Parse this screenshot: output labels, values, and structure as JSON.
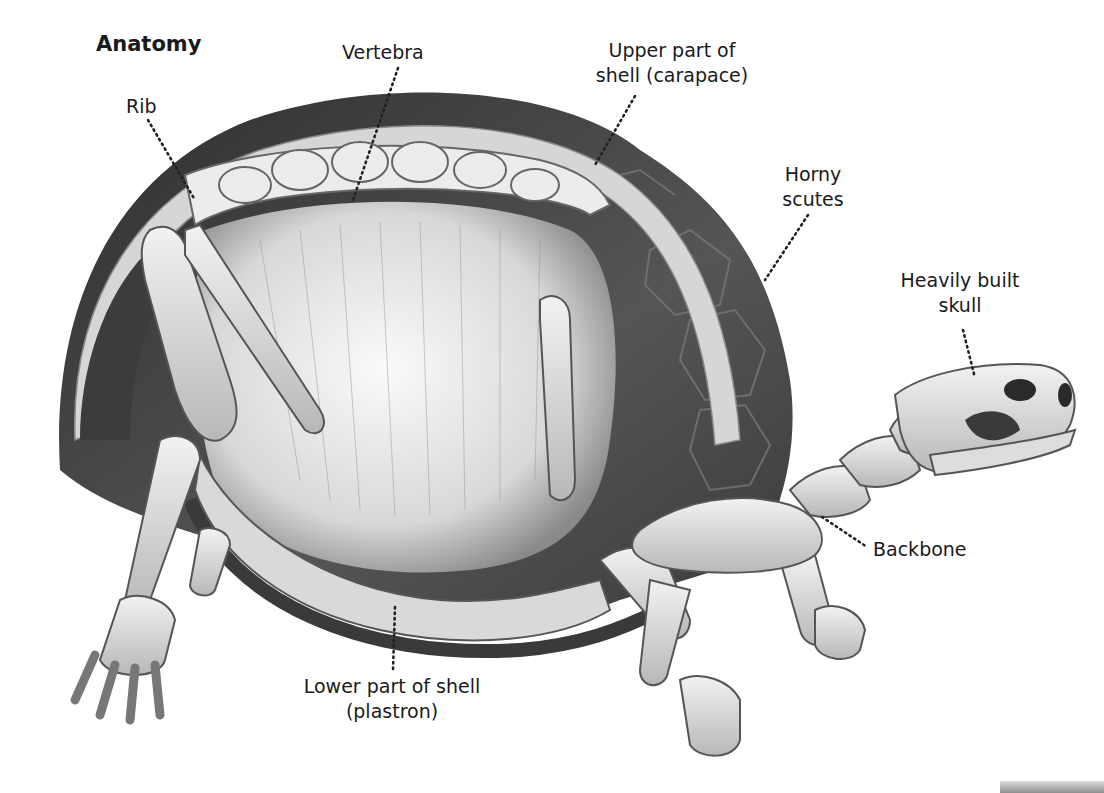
{
  "diagram": {
    "title": "Anatomy",
    "labels": [
      {
        "id": "rib",
        "text": "Rib"
      },
      {
        "id": "vertebra",
        "text": "Vertebra"
      },
      {
        "id": "carapace",
        "line1": "Upper part of",
        "line2": "shell (carapace)"
      },
      {
        "id": "scutes",
        "line1": "Horny",
        "line2": "scutes"
      },
      {
        "id": "skull",
        "line1": "Heavily built",
        "line2": "skull"
      },
      {
        "id": "backbone",
        "text": "Backbone"
      },
      {
        "id": "plastron",
        "line1": "Lower part of shell",
        "line2": "(plastron)"
      }
    ]
  },
  "colors": {
    "background": "#ffffff",
    "text": "#1a1a1a",
    "shell_dark": "#3a3a3a",
    "bone": "#e6e6e6"
  }
}
